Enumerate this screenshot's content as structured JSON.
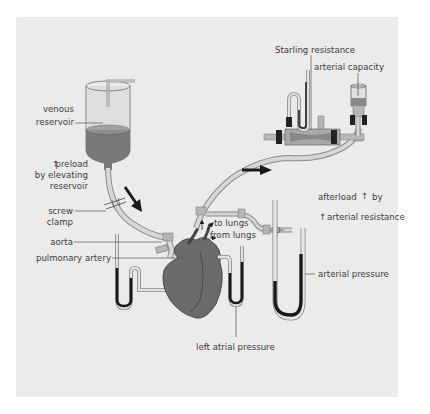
{
  "diagram": {
    "labels": {
      "venous_reservoir_line1": "venous",
      "venous_reservoir_line2": "reservoir",
      "preload_line1": "preload",
      "preload_line2": "by elevating",
      "preload_line3": "reservoir",
      "screw_clamp_line1": "screw",
      "screw_clamp_line2": "clamp",
      "aorta": "aorta",
      "pulmonary_artery": "pulmonary artery",
      "to_lungs": "to lungs",
      "from_lungs": "from lungs",
      "left_atrial_pressure": "left atrial pressure",
      "starling_resistance": "Starling resistance",
      "arterial_capacity": "arterial capacity",
      "afterload_line1": "afterload",
      "afterload_by": "by",
      "afterload_line2": "arterial resistance",
      "arterial_pressure": "arterial pressure"
    },
    "arrow_glyph": "↑",
    "colors": {
      "panel_bg": "#ebebeb",
      "fluid": "#6e6e6e",
      "heart": "#6b6b6b",
      "tube": "#bdbdbd",
      "mercury": "#1a1a1a",
      "text": "#3c3c3c"
    }
  }
}
